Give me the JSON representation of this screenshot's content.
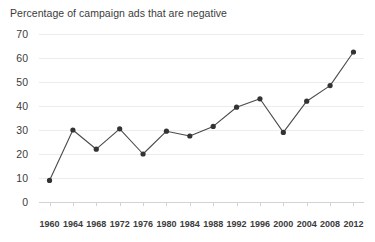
{
  "chart_data": {
    "type": "line",
    "title": "Percentage of campaign ads that are negative",
    "xlabel": "",
    "ylabel": "",
    "categories": [
      "1960",
      "1964",
      "1968",
      "1972",
      "1976",
      "1980",
      "1984",
      "1988",
      "1992",
      "1996",
      "2000",
      "2004",
      "2008",
      "2012"
    ],
    "values": [
      9,
      30,
      22,
      30.5,
      20,
      29.5,
      27.5,
      31.5,
      39.5,
      43,
      29,
      42,
      48.5,
      62.5
    ],
    "series": [
      {
        "name": "Percentage of campaign ads that are negative",
        "values": [
          9,
          30,
          22,
          30.5,
          20,
          29.5,
          27.5,
          31.5,
          39.5,
          43,
          29,
          42,
          48.5,
          62.5
        ]
      }
    ],
    "ylim": [
      0,
      70
    ],
    "y_ticks": [
      0,
      10,
      20,
      30,
      40,
      50,
      60,
      70
    ],
    "y_tick_labels": [
      "0",
      "10",
      "20",
      "30",
      "40",
      "50",
      "60",
      "70"
    ],
    "grid": true,
    "legend": "none",
    "marker": "circle",
    "colors": {
      "line": "#4a4a4a",
      "marker": "#333333",
      "grid": "#ececec",
      "axis": "#d2d2d2",
      "text": "#3c3c3c",
      "background": "#ffffff"
    }
  }
}
